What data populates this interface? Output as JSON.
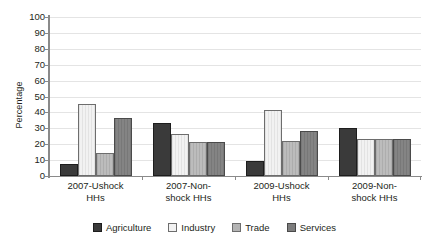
{
  "chart_data": {
    "type": "bar",
    "title": "",
    "xlabel": "",
    "ylabel": "Percentage",
    "ylim": [
      0,
      100
    ],
    "ytick_step": 10,
    "yticks": [
      100,
      90,
      80,
      70,
      60,
      50,
      40,
      30,
      20,
      10,
      0
    ],
    "grid": true,
    "legend_position": "bottom",
    "categories": [
      "2007-Ushock HHs",
      "2007-Non-shock HHs",
      "2009-Ushock HHs",
      "2009-Non-shock HHs"
    ],
    "category_lines": [
      [
        "2007-Ushock",
        "HHs"
      ],
      [
        "2007-Non-",
        "shock HHs"
      ],
      [
        "2009-Ushock",
        "HHs"
      ],
      [
        "2009-Non-",
        "shock HHs"
      ]
    ],
    "series": [
      {
        "name": "Agriculture",
        "color": "#3a3a3a",
        "values": [
          6,
          32,
          8,
          29
        ]
      },
      {
        "name": "Industry",
        "color": "#f2f2f2",
        "values": [
          44,
          25,
          40,
          22
        ]
      },
      {
        "name": "Trade",
        "color": "#b4b4b4",
        "values": [
          13.5,
          20,
          21,
          22
        ]
      },
      {
        "name": "Services",
        "color": "#7d7d7d",
        "values": [
          35.5,
          20,
          27,
          22
        ]
      }
    ]
  },
  "legend": {
    "items": [
      {
        "label": "Agriculture"
      },
      {
        "label": "Industry"
      },
      {
        "label": "Trade"
      },
      {
        "label": "Services"
      }
    ]
  }
}
